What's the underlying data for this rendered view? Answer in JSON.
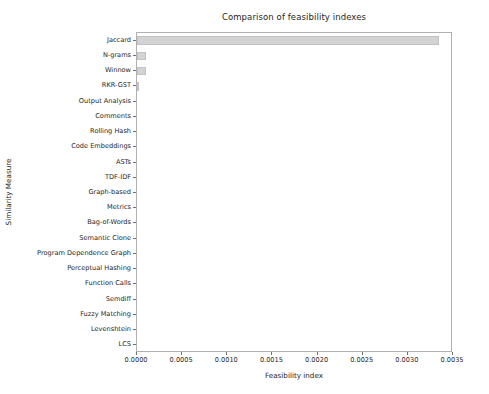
{
  "chart_data": {
    "type": "bar",
    "orientation": "horizontal",
    "title": "Comparison of feasibility indexes",
    "xlabel": "Feasibility index",
    "ylabel": "Similarity Measure",
    "categories": [
      "Jaccard",
      "N-grams",
      "Winnow",
      "RKR-GST",
      "Output Analysis",
      "Comments",
      "Rolling Hash",
      "Code Embeddings",
      "ASTs",
      "TDF-IDF",
      "Graph-based",
      "Metrics",
      "Bag-of-Words",
      "Semantic Clone",
      "Program Dependence Graph",
      "Perceptual Hashing",
      "Function Calls",
      "Semdiff",
      "Fuzzy Matching",
      "Levenshtein",
      "LCS"
    ],
    "values": [
      0.00334,
      0.0001,
      0.0001,
      2e-05,
      0.0,
      0.0,
      0.0,
      0.0,
      0.0,
      0.0,
      0.0,
      0.0,
      0.0,
      0.0,
      0.0,
      0.0,
      0.0,
      0.0,
      0.0,
      0.0,
      0.0
    ],
    "xlim": [
      0.0,
      0.0035
    ],
    "xticks": [
      0.0,
      0.0005,
      0.001,
      0.0015,
      0.002,
      0.0025,
      0.003,
      0.0035
    ],
    "xtick_labels": [
      "0.0000",
      "0.0005",
      "0.0010",
      "0.0015",
      "0.0020",
      "0.0025",
      "0.0030",
      "0.0035"
    ],
    "grid": false,
    "legend": null,
    "bar_color": "#d3d3d3",
    "bar_edge_color": "#c2c2c2",
    "axes_color": "#b0b0b0",
    "text_color": "#262626",
    "background": "#ffffff"
  }
}
